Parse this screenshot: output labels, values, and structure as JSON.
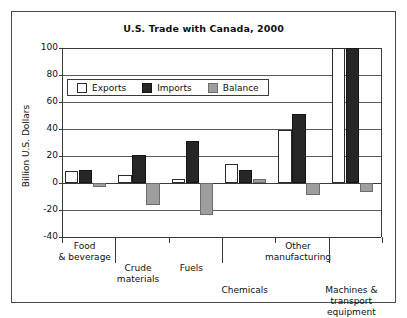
{
  "figure": {
    "title": "U.S. Trade with Canada, 2000",
    "ylabel": "Billion U.S. Dollars"
  },
  "legend": {
    "items": [
      {
        "label": "Exports",
        "color": "#ffffff",
        "key": "exports"
      },
      {
        "label": "Imports",
        "color": "#262626",
        "key": "imports"
      },
      {
        "label": "Balance",
        "color": "#9e9e9e",
        "key": "balance"
      }
    ]
  },
  "axis": {
    "yticks": [
      "100",
      "80",
      "60",
      "40",
      "20",
      "0",
      "-20",
      "-40"
    ],
    "ytick_values": [
      100,
      80,
      60,
      40,
      20,
      0,
      -20,
      -40
    ]
  },
  "chart_data": {
    "type": "bar",
    "title": "U.S. Trade with Canada, 2000",
    "xlabel": "",
    "ylabel": "Billion U.S. Dollars",
    "ylim": [
      -40,
      100
    ],
    "ytick_step": 20,
    "grid": true,
    "legend_position": "upper-left-inside",
    "categories": [
      "Food & beverage",
      "Crude materials",
      "Fuels",
      "Chemicals",
      "Other manufacturing",
      "Machines & transport equipment"
    ],
    "category_lines": [
      [
        "Food",
        "& beverage"
      ],
      [
        "Crude",
        "materials"
      ],
      [
        "Fuels"
      ],
      [
        "Chemicals"
      ],
      [
        "Other",
        "manufacturing"
      ],
      [
        "Machines &",
        "transport",
        "equipment"
      ]
    ],
    "series": [
      {
        "name": "Exports",
        "color": "#ffffff",
        "values": [
          9,
          6,
          3,
          14,
          39,
          100
        ]
      },
      {
        "name": "Imports",
        "color": "#262626",
        "values": [
          10,
          21,
          31,
          10,
          51,
          100
        ]
      },
      {
        "name": "Balance",
        "color": "#9e9e9e",
        "values": [
          -3,
          -16,
          -24,
          3,
          -9,
          -7
        ]
      }
    ]
  }
}
